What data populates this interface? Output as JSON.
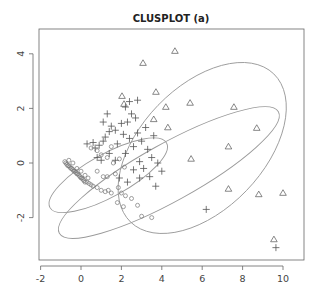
{
  "chart_data": {
    "type": "scatter",
    "title": "CLUSPLOT (a)",
    "xlabel": "",
    "ylabel": "",
    "xlim": [
      -2.2,
      10.9
    ],
    "ylim": [
      -3.5,
      4.9
    ],
    "x_ticks": [
      -2,
      0,
      2,
      4,
      6,
      8,
      10
    ],
    "y_ticks": [
      -2,
      0,
      2,
      4
    ],
    "grid": false,
    "legend": null,
    "series": [
      {
        "name": "cluster 1",
        "marker": "circle",
        "points": [
          [
            -0.8,
            0.05
          ],
          [
            -0.75,
            0.0
          ],
          [
            -0.7,
            -0.05
          ],
          [
            -0.65,
            -0.1
          ],
          [
            -0.6,
            -0.1
          ],
          [
            -0.55,
            -0.15
          ],
          [
            -0.5,
            -0.2
          ],
          [
            -0.45,
            -0.2
          ],
          [
            -0.4,
            -0.25
          ],
          [
            -0.35,
            -0.3
          ],
          [
            -0.3,
            -0.3
          ],
          [
            -0.25,
            -0.35
          ],
          [
            -0.2,
            -0.4
          ],
          [
            -0.15,
            -0.4
          ],
          [
            -0.1,
            -0.45
          ],
          [
            -0.05,
            -0.5
          ],
          [
            0.0,
            -0.55
          ],
          [
            0.05,
            -0.55
          ],
          [
            0.1,
            -0.6
          ],
          [
            0.15,
            -0.65
          ],
          [
            0.2,
            -0.7
          ],
          [
            0.3,
            -0.7
          ],
          [
            0.4,
            -0.75
          ],
          [
            0.5,
            -0.8
          ],
          [
            -0.6,
            0.1
          ],
          [
            -0.4,
            0.0
          ],
          [
            -0.2,
            -0.2
          ],
          [
            0.0,
            -0.3
          ],
          [
            0.2,
            -0.45
          ],
          [
            0.35,
            -0.55
          ],
          [
            0.6,
            -0.85
          ],
          [
            0.8,
            -0.9
          ],
          [
            1.0,
            -1.0
          ],
          [
            1.2,
            -1.05
          ],
          [
            1.35,
            -1.0
          ],
          [
            1.5,
            -1.1
          ],
          [
            0.5,
            0.55
          ],
          [
            0.8,
            0.45
          ],
          [
            1.0,
            0.3
          ],
          [
            1.3,
            0.2
          ],
          [
            1.6,
            0.0
          ],
          [
            0.8,
            -0.3
          ],
          [
            1.1,
            -0.5
          ],
          [
            1.3,
            -0.5
          ],
          [
            1.7,
            -0.4
          ],
          [
            1.85,
            -0.9
          ],
          [
            2.0,
            -1.1
          ],
          [
            2.2,
            -1.2
          ],
          [
            1.8,
            -1.45
          ],
          [
            2.1,
            -1.6
          ],
          [
            2.5,
            -1.3
          ],
          [
            2.8,
            -1.55
          ],
          [
            3.0,
            -1.95
          ],
          [
            3.5,
            -2.0
          ],
          [
            1.5,
            0.6
          ],
          [
            1.9,
            0.15
          ],
          [
            2.15,
            -0.15
          ]
        ]
      },
      {
        "name": "cluster 2",
        "marker": "plus",
        "points": [
          [
            0.3,
            0.7
          ],
          [
            0.6,
            0.75
          ],
          [
            0.7,
            0.55
          ],
          [
            1.1,
            0.8
          ],
          [
            1.2,
            0.95
          ],
          [
            1.4,
            1.15
          ],
          [
            1.5,
            1.35
          ],
          [
            1.7,
            1.2
          ],
          [
            2.0,
            1.45
          ],
          [
            2.3,
            1.5
          ],
          [
            2.5,
            1.8
          ],
          [
            2.7,
            1.65
          ],
          [
            2.1,
            1.05
          ],
          [
            2.4,
            0.9
          ],
          [
            2.8,
            1.1
          ],
          [
            3.2,
            1.3
          ],
          [
            3.0,
            0.8
          ],
          [
            3.3,
            0.5
          ],
          [
            2.6,
            0.6
          ],
          [
            2.2,
            0.35
          ],
          [
            1.7,
            0.1
          ],
          [
            1.4,
            0.35
          ],
          [
            1.0,
            0.1
          ],
          [
            0.8,
            0.2
          ],
          [
            2.9,
            0.05
          ],
          [
            3.5,
            0.2
          ],
          [
            3.8,
            0.0
          ],
          [
            4.0,
            -0.3
          ],
          [
            3.4,
            -0.5
          ],
          [
            2.9,
            -0.55
          ],
          [
            2.6,
            -0.25
          ],
          [
            2.3,
            -0.7
          ],
          [
            1.9,
            -0.55
          ],
          [
            3.7,
            -0.85
          ],
          [
            2.2,
            2.05
          ],
          [
            2.4,
            2.25
          ],
          [
            1.3,
            1.8
          ],
          [
            1.1,
            1.5
          ],
          [
            2.8,
            2.3
          ],
          [
            3.6,
            1.0
          ],
          [
            6.2,
            -1.7
          ],
          [
            9.65,
            -3.1
          ],
          [
            0.9,
            0.65
          ],
          [
            1.8,
            0.7
          ],
          [
            3.1,
            -0.2
          ]
        ]
      },
      {
        "name": "cluster 3",
        "marker": "triangle",
        "points": [
          [
            4.65,
            4.1
          ],
          [
            3.07,
            3.66
          ],
          [
            3.71,
            2.6
          ],
          [
            4.2,
            2.05
          ],
          [
            5.4,
            2.2
          ],
          [
            7.57,
            2.05
          ],
          [
            3.6,
            1.6
          ],
          [
            4.3,
            1.3
          ],
          [
            8.7,
            1.28
          ],
          [
            2.03,
            2.45
          ],
          [
            2.13,
            2.16
          ],
          [
            5.45,
            0.15
          ],
          [
            7.3,
            0.6
          ],
          [
            7.3,
            -0.95
          ],
          [
            8.8,
            -1.15
          ],
          [
            10.0,
            -1.1
          ],
          [
            9.55,
            -2.8
          ]
        ]
      }
    ],
    "ellipses": [
      {
        "cluster": "cluster 1",
        "cx": 1.35,
        "cy": -0.45,
        "rx": 3.3,
        "ry": 0.78,
        "angle_deg": -29
      },
      {
        "cluster": "cluster 2",
        "cx": 4.35,
        "cy": -0.35,
        "rx": 6.2,
        "ry": 1.05,
        "angle_deg": -29
      },
      {
        "cluster": "cluster 3",
        "cx": 6.0,
        "cy": 0.55,
        "rx": 5.1,
        "ry": 2.25,
        "angle_deg": -46
      }
    ]
  }
}
